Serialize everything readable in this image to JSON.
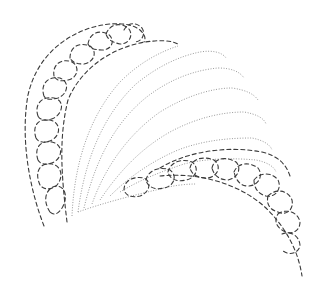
{
  "illustration": {
    "subject": "braided hairstyle line-art pattern",
    "colors": {
      "background": "#ffffff",
      "dashed_outline": "#3a3a3a",
      "dotted_hair_lines": "#9a9a9a"
    },
    "elements": {
      "outer_outline": "dashed",
      "left_braid": "dashed loops",
      "bottom_braid": "dashed loops",
      "hair_strands": "dotted arcs",
      "hair_strand_count": 8
    }
  }
}
